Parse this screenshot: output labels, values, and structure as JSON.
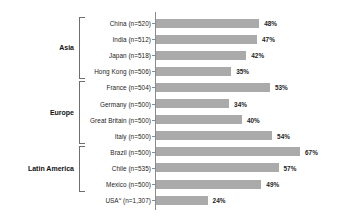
{
  "chart_data": {
    "type": "bar",
    "orientation": "horizontal",
    "title": "",
    "subtitle": "",
    "xlabel": "",
    "ylabel": "",
    "xlim": [
      0,
      70
    ],
    "grid": false,
    "legend": null,
    "value_suffix": "%",
    "bar_color": "#aaaaaa",
    "axis_color": "#8a8a8a",
    "bracket_color": "#6f6f6f",
    "categories": [
      "China (n=520)",
      "India (n=512)",
      "Japan (n=518)",
      "Hong Kong (n=506)",
      "France (n=504)",
      "Germany (n=500)",
      "Great Britain (n=500)",
      "Italy (n=500)",
      "Brazil (n=500)",
      "Chile (n=535)",
      "Mexico (n=500)",
      "USA (n=1,307)"
    ],
    "values": [
      48,
      47,
      42,
      35,
      53,
      34,
      40,
      54,
      67,
      57,
      49,
      24
    ],
    "value_labels": [
      "48%",
      "47%",
      "42%",
      "35%",
      "53%",
      "34%",
      "40%",
      "54%",
      "67%",
      "57%",
      "49%",
      "24%"
    ],
    "groups": [
      {
        "label": "Asia",
        "first_index": 0,
        "last_index": 3
      },
      {
        "label": "Europe",
        "first_index": 4,
        "last_index": 7
      },
      {
        "label": "Latin America",
        "first_index": 8,
        "last_index": 10
      }
    ],
    "footnote_marker": "a",
    "rows": [
      {
        "label": "China",
        "sample": "(n=520)",
        "label_full": "China (n=520)",
        "value": 48,
        "value_label": "48%",
        "group": "Asia",
        "superscript": ""
      },
      {
        "label": "India",
        "sample": "(n=512)",
        "label_full": "India (n=512)",
        "value": 47,
        "value_label": "47%",
        "group": "Asia",
        "superscript": ""
      },
      {
        "label": "Japan",
        "sample": "(n=518)",
        "label_full": "Japan (n=518)",
        "value": 42,
        "value_label": "42%",
        "group": "Asia",
        "superscript": ""
      },
      {
        "label": "Hong Kong",
        "sample": "(n=506)",
        "label_full": "Hong Kong (n=506)",
        "value": 35,
        "value_label": "35%",
        "group": "Asia",
        "superscript": ""
      },
      {
        "label": "France",
        "sample": "(n=504)",
        "label_full": "France (n=504)",
        "value": 53,
        "value_label": "53%",
        "group": "Europe",
        "superscript": ""
      },
      {
        "label": "Germany",
        "sample": "(n=500)",
        "label_full": "Germany (n=500)",
        "value": 34,
        "value_label": "34%",
        "group": "Europe",
        "superscript": ""
      },
      {
        "label": "Great Britain",
        "sample": "(n=500)",
        "label_full": "Great Britain (n=500)",
        "value": 40,
        "value_label": "40%",
        "group": "Europe",
        "superscript": ""
      },
      {
        "label": "Italy",
        "sample": "(n=500)",
        "label_full": "Italy (n=500)",
        "value": 54,
        "value_label": "54%",
        "group": "Europe",
        "superscript": ""
      },
      {
        "label": "Brazil",
        "sample": "(n=500)",
        "label_full": "Brazil (n=500)",
        "value": 67,
        "value_label": "67%",
        "group": "Latin America",
        "superscript": ""
      },
      {
        "label": "Chile",
        "sample": "(n=535)",
        "label_full": "Chile (n=535)",
        "value": 57,
        "value_label": "57%",
        "group": "Latin America",
        "superscript": ""
      },
      {
        "label": "Mexico",
        "sample": "(n=500)",
        "label_full": "Mexico (n=500)",
        "value": 49,
        "value_label": "49%",
        "group": "Latin America",
        "superscript": ""
      },
      {
        "label": "USA",
        "sample": "(n=1,307)",
        "label_full": "USA (n=1,307)",
        "value": 24,
        "value_label": "24%",
        "group": "",
        "superscript": "a"
      }
    ]
  },
  "layout": {
    "row_top_start": 16,
    "row_pitch": 16.1,
    "axis_x": 155,
    "bar_origin_x": 156,
    "px_per_percent": 2.15,
    "value_label_gap": 5
  }
}
